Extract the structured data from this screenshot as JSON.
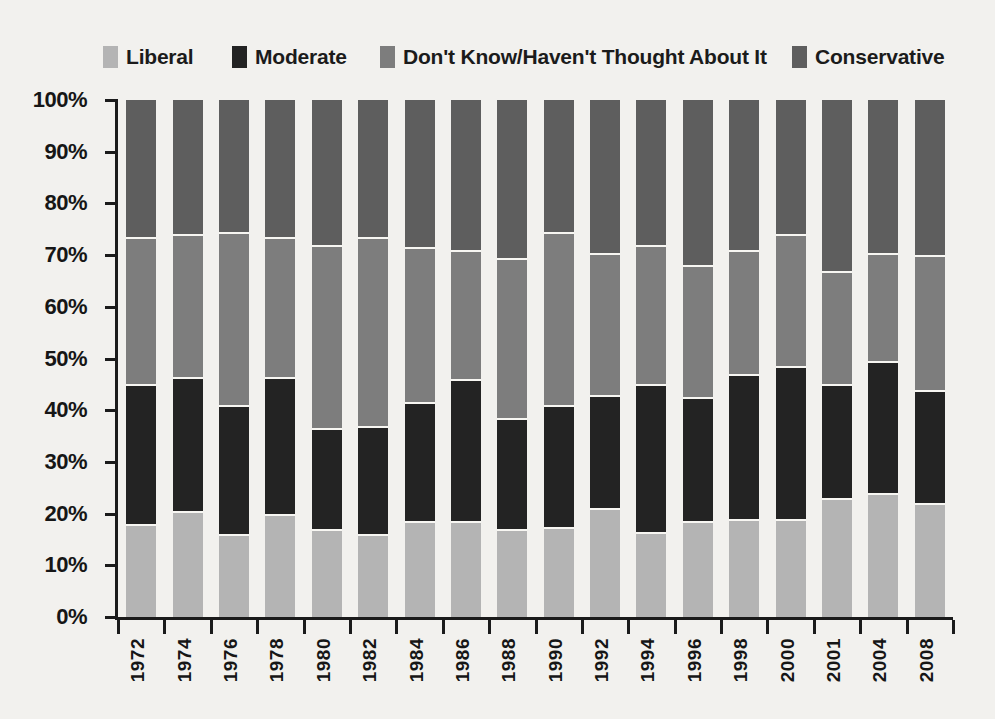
{
  "page": {
    "background": "#f2f1ee",
    "text_color": "#1b1b1b"
  },
  "legend": {
    "items": [
      {
        "label": "Liberal",
        "color": "#b4b4b4"
      },
      {
        "label": "Moderate",
        "color": "#232323"
      },
      {
        "label": "Don't Know/Haven't Thought About It",
        "color": "#7d7d7d"
      },
      {
        "label": "Conservative",
        "color": "#5e5e5e"
      }
    ]
  },
  "chart_data": {
    "type": "bar",
    "stacked": true,
    "title": "",
    "xlabel": "",
    "ylabel": "",
    "ylim": [
      0,
      100
    ],
    "grid": false,
    "legend_position": "top",
    "y_tick_labels": [
      "100%",
      "90%",
      "80%",
      "70%",
      "60%",
      "50%",
      "40%",
      "30%",
      "20%",
      "10%",
      "0%"
    ],
    "categories": [
      "1972",
      "1974",
      "1976",
      "1978",
      "1980",
      "1982",
      "1984",
      "1986",
      "1988",
      "1990",
      "1992",
      "1994",
      "1996",
      "1998",
      "2000",
      "2001",
      "2004",
      "2008"
    ],
    "series": [
      {
        "name": "Liberal",
        "color": "#b4b4b4",
        "values": [
          18,
          20.5,
          16,
          20,
          17,
          16,
          18.5,
          18.5,
          17,
          17.5,
          21,
          16.5,
          18.5,
          19,
          19,
          23,
          24,
          22
        ]
      },
      {
        "name": "Moderate",
        "color": "#232323",
        "values": [
          27,
          26,
          25,
          26.5,
          19.5,
          21,
          23,
          27.5,
          21.5,
          23.5,
          22,
          28.5,
          24,
          28,
          29.5,
          22,
          25.5,
          22
        ]
      },
      {
        "name": "Don't Know/Haven't Thought About It",
        "color": "#7d7d7d",
        "values": [
          28.5,
          27.5,
          33.5,
          27,
          35.5,
          36.5,
          30,
          25,
          31,
          33.5,
          27.5,
          27,
          25.5,
          24,
          25.5,
          22,
          21,
          26
        ]
      },
      {
        "name": "Conservative",
        "color": "#5e5e5e",
        "values": [
          26.5,
          26,
          25.5,
          26.5,
          28,
          26.5,
          28.5,
          29,
          30.5,
          25.5,
          29.5,
          28,
          32,
          29,
          26,
          33,
          29.5,
          30
        ]
      }
    ]
  }
}
